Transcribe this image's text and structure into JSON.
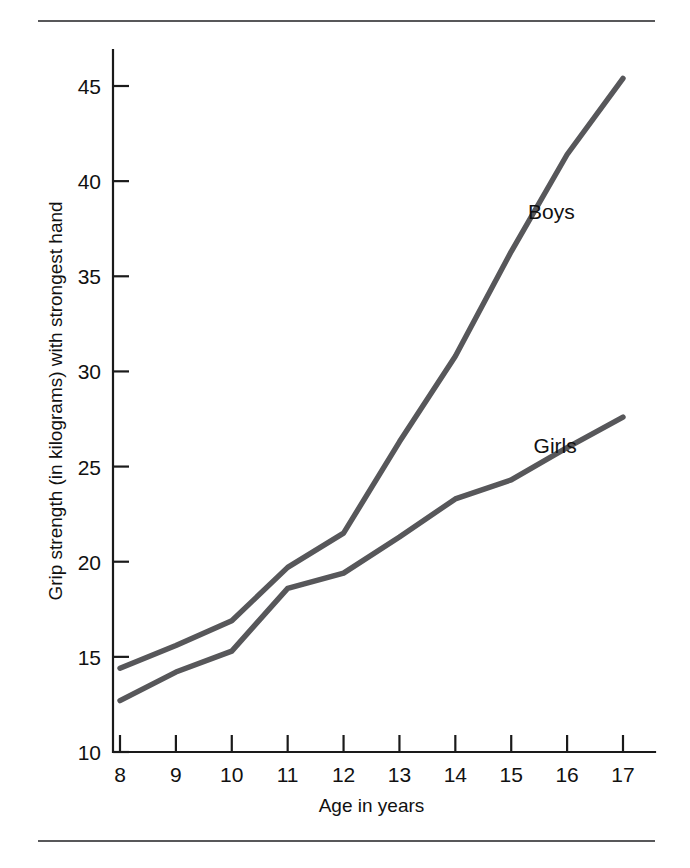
{
  "chart_data": {
    "type": "line",
    "title": "",
    "xlabel": "Age in years",
    "ylabel": "Grip strength (in kilograms) with strongest hand",
    "x": [
      8,
      9,
      10,
      11,
      12,
      13,
      14,
      15,
      16,
      17
    ],
    "categories": [
      "8",
      "9",
      "10",
      "11",
      "12",
      "13",
      "14",
      "15",
      "16",
      "17"
    ],
    "xticklabels": [
      "8",
      "9",
      "10",
      "11",
      "12",
      "13",
      "14",
      "15",
      "16",
      "17"
    ],
    "yticklabels": [
      "10",
      "15",
      "20",
      "25",
      "30",
      "35",
      "40",
      "45"
    ],
    "yticks": [
      10,
      15,
      20,
      25,
      30,
      35,
      40,
      45
    ],
    "xlim": [
      8,
      17
    ],
    "ylim": [
      10,
      46
    ],
    "grid": false,
    "legend_position": "inline-annotations",
    "series": [
      {
        "name": "Boys",
        "color": "#57575a",
        "values": [
          14.4,
          15.6,
          16.9,
          19.7,
          21.5,
          26.3,
          30.8,
          36.3,
          41.4,
          45.4
        ],
        "annotation": {
          "label": "Boys",
          "x": 15.3,
          "y": 38.0
        }
      },
      {
        "name": "Girls",
        "color": "#57575a",
        "values": [
          12.7,
          14.2,
          15.3,
          18.6,
          19.4,
          21.3,
          23.3,
          24.3,
          26.0,
          27.6
        ],
        "annotation": {
          "label": "Girls",
          "x": 15.4,
          "y": 25.7
        }
      }
    ]
  },
  "figure": {
    "rule_color": "#58585a",
    "axis_color": "#1a1a1a",
    "background": "#ffffff"
  }
}
